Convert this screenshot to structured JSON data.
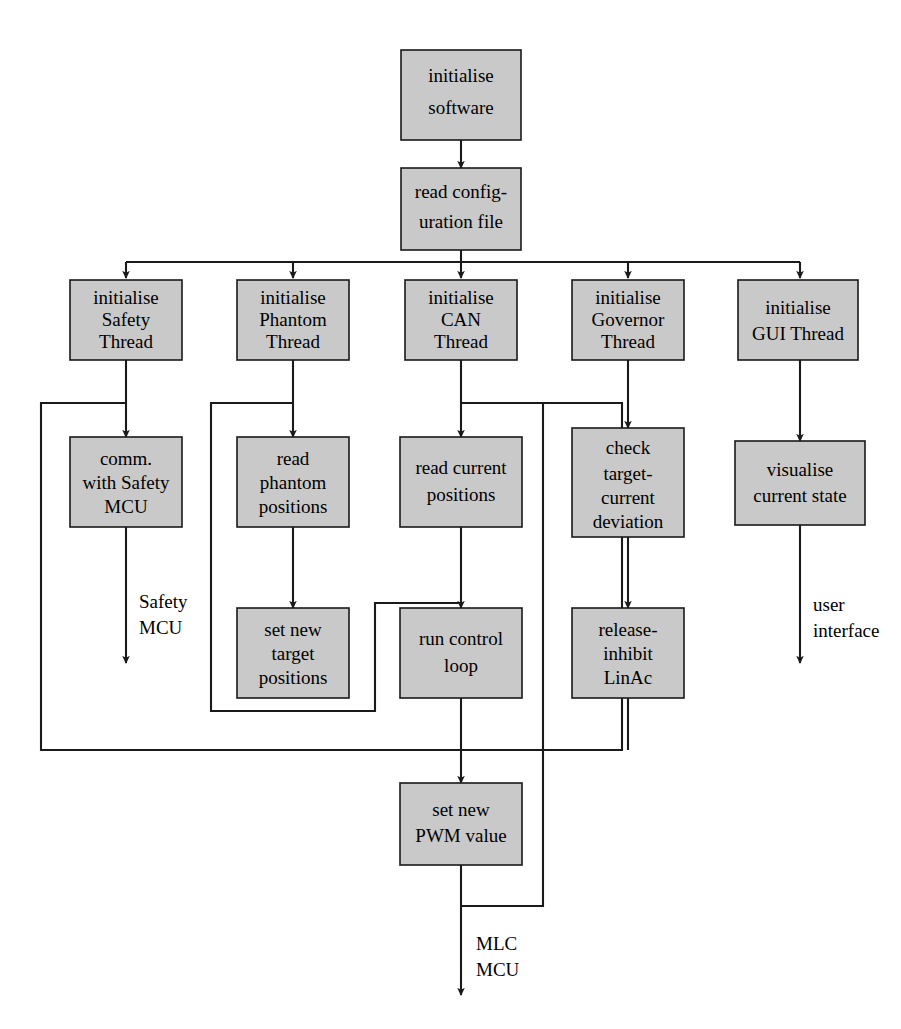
{
  "diagram": {
    "type": "flowchart",
    "title": "",
    "fill_color": "#c9c9c9",
    "stroke_color": "#1a1a1a",
    "background_color": "#ffffff",
    "nodes": [
      {
        "id": "init_software",
        "lines": [
          "initialise",
          "software"
        ]
      },
      {
        "id": "read_config",
        "lines": [
          "read config-",
          "uration file"
        ]
      },
      {
        "id": "init_safety",
        "lines": [
          "initialise",
          "Safety",
          "Thread"
        ]
      },
      {
        "id": "init_phantom",
        "lines": [
          "initialise",
          "Phantom",
          "Thread"
        ]
      },
      {
        "id": "init_can",
        "lines": [
          "initialise",
          "CAN",
          "Thread"
        ]
      },
      {
        "id": "init_governor",
        "lines": [
          "initialise",
          "Governor",
          "Thread"
        ]
      },
      {
        "id": "init_gui",
        "lines": [
          "initialise",
          "GUI Thread"
        ]
      },
      {
        "id": "comm_safety_mcu",
        "lines": [
          "comm.",
          "with Safety",
          "MCU"
        ]
      },
      {
        "id": "read_phantom",
        "lines": [
          "read",
          "phantom",
          "positions"
        ]
      },
      {
        "id": "read_current",
        "lines": [
          "read current",
          "positions"
        ]
      },
      {
        "id": "check_deviation",
        "lines": [
          "check",
          "target-",
          "current",
          "deviation"
        ]
      },
      {
        "id": "visualise_state",
        "lines": [
          "visualise",
          "current state"
        ]
      },
      {
        "id": "set_target",
        "lines": [
          "set new",
          "target",
          "positions"
        ]
      },
      {
        "id": "run_control_loop",
        "lines": [
          "run control",
          "loop"
        ]
      },
      {
        "id": "release_inhibit",
        "lines": [
          "release-",
          "inhibit",
          "LinAc"
        ]
      },
      {
        "id": "set_pwm",
        "lines": [
          "set new",
          "PWM value"
        ]
      }
    ],
    "edge_labels": [
      {
        "id": "safety-mcu-label",
        "lines": [
          "Safety",
          "MCU"
        ]
      },
      {
        "id": "user-interface-label",
        "lines": [
          "user",
          "interface"
        ]
      },
      {
        "id": "mlc-mcu-label",
        "lines": [
          "MLC",
          "MCU"
        ]
      }
    ]
  }
}
